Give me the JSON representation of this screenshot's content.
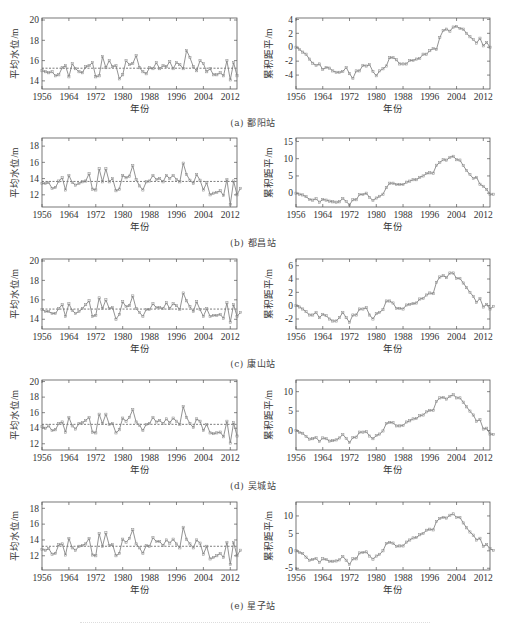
{
  "figure": {
    "footer_text": ""
  },
  "rows": [
    {
      "caption": "(a) 鄱阳站"
    },
    {
      "caption": "(b) 都昌站"
    },
    {
      "caption": "(c) 康山站"
    },
    {
      "caption": "(d) 吴城站"
    },
    {
      "caption": "(e) 星子站"
    }
  ],
  "chart_data": [
    {
      "id": "a-left",
      "station": "鄱阳站",
      "type": "line",
      "title": "",
      "xlabel": "年份",
      "ylabel": "平均水位/m",
      "xlim": [
        1956,
        2014
      ],
      "ylim": [
        13.2,
        20.2
      ],
      "xticks": [
        1956,
        1964,
        1972,
        1980,
        1988,
        1996,
        2004,
        2012
      ],
      "yticks": [
        14,
        16,
        18,
        20
      ],
      "mean_line": 15.25,
      "x_start": 1956,
      "values": [
        15.0,
        14.9,
        14.8,
        14.9,
        14.5,
        14.6,
        15.3,
        15.5,
        14.4,
        15.7,
        15.2,
        14.9,
        14.8,
        15.4,
        15.5,
        15.8,
        14.4,
        14.5,
        16.4,
        15.3,
        16.0,
        15.4,
        15.5,
        14.2,
        14.6,
        16.0,
        15.6,
        15.7,
        16.5,
        15.3,
        14.9,
        14.7,
        15.3,
        15.2,
        15.8,
        15.2,
        15.5,
        15.4,
        15.9,
        15.2,
        15.8,
        15.6,
        15.2,
        17.0,
        16.3,
        15.4,
        15.0,
        16.0,
        15.7,
        14.9,
        15.2,
        14.6,
        14.6,
        14.8,
        14.5,
        16.0,
        14.1,
        15.8,
        14.5
      ]
    },
    {
      "id": "a-right",
      "station": "鄱阳站",
      "type": "line",
      "title": "",
      "xlabel": "年份",
      "ylabel": "累积距平/m",
      "xlim": [
        1956,
        2014
      ],
      "ylim": [
        -6,
        4.2
      ],
      "xticks": [
        1956,
        1964,
        1972,
        1980,
        1988,
        1996,
        2004,
        2012
      ],
      "yticks": [
        -4,
        -2,
        0,
        2,
        4
      ],
      "x_start": 1956,
      "values": [
        0.0,
        -0.3,
        -0.7,
        -1.0,
        -1.7,
        -2.3,
        -2.6,
        -2.4,
        -3.2,
        -2.9,
        -3.0,
        -3.4,
        -3.6,
        -3.6,
        -3.5,
        -2.9,
        -3.8,
        -4.5,
        -3.4,
        -3.4,
        -2.6,
        -2.7,
        -2.5,
        -3.5,
        -4.1,
        -3.4,
        -3.1,
        -2.7,
        -1.5,
        -1.5,
        -1.8,
        -2.4,
        -2.4,
        -2.4,
        -1.9,
        -1.9,
        -1.7,
        -1.6,
        -1.0,
        -1.0,
        -0.5,
        -0.2,
        -0.3,
        1.4,
        2.4,
        2.6,
        2.3,
        2.9,
        3.0,
        2.7,
        2.6,
        2.0,
        1.5,
        1.1,
        0.6,
        1.3,
        0.2,
        0.7,
        0.0
      ]
    },
    {
      "id": "b-left",
      "station": "都昌站",
      "type": "line",
      "title": "",
      "xlabel": "年份",
      "ylabel": "平均水位/m",
      "xlim": [
        1956,
        2014
      ],
      "ylim": [
        10.5,
        19.0
      ],
      "xticks": [
        1956,
        1964,
        1972,
        1980,
        1988,
        1996,
        2004,
        2012
      ],
      "yticks": [
        12,
        14,
        16,
        18
      ],
      "mean_line": 13.65,
      "x_start": 1956,
      "values": [
        13.4,
        13.4,
        13.5,
        12.8,
        12.9,
        13.7,
        14.1,
        12.6,
        14.4,
        13.5,
        13.2,
        13.4,
        13.6,
        13.7,
        14.6,
        12.7,
        12.6,
        15.2,
        13.6,
        15.2,
        13.6,
        14.0,
        12.5,
        12.7,
        14.4,
        14.1,
        14.3,
        15.6,
        13.9,
        13.1,
        12.6,
        13.6,
        13.7,
        14.4,
        13.9,
        14.0,
        13.6,
        14.4,
        14.0,
        14.4,
        13.9,
        13.6,
        15.9,
        14.5,
        13.8,
        13.4,
        14.5,
        13.8,
        12.6,
        13.5,
        12.0,
        12.2,
        12.3,
        12.5,
        11.9,
        13.9,
        10.8,
        13.7,
        12.0,
        12.8
      ]
    },
    {
      "id": "b-right",
      "station": "都昌站",
      "type": "line",
      "title": "",
      "xlabel": "年份",
      "ylabel": "累积距平/m",
      "xlim": [
        1956,
        2014
      ],
      "ylim": [
        -4,
        16
      ],
      "xticks": [
        1956,
        1964,
        1972,
        1980,
        1988,
        1996,
        2004,
        2012
      ],
      "yticks": [
        0,
        5,
        10,
        15
      ],
      "x_start": 1956,
      "values": [
        0.0,
        -0.3,
        -0.5,
        -1.0,
        -1.8,
        -2.0,
        -1.6,
        -2.6,
        -1.8,
        -2.0,
        -2.3,
        -2.5,
        -2.6,
        -2.5,
        -1.5,
        -2.4,
        -3.4,
        -1.9,
        -1.9,
        -0.4,
        -0.4,
        0.0,
        -1.2,
        -2.1,
        -1.4,
        -0.9,
        -0.3,
        1.6,
        2.9,
        2.9,
        2.5,
        2.5,
        2.5,
        3.2,
        3.5,
        3.9,
        3.9,
        4.6,
        5.0,
        5.7,
        5.9,
        5.8,
        8.1,
        8.9,
        9.7,
        9.6,
        10.4,
        10.7,
        9.7,
        9.6,
        8.0,
        6.6,
        5.4,
        4.3,
        4.6,
        2.6,
        2.0,
        1.1,
        -0.3,
        -0.3
      ]
    },
    {
      "id": "c-left",
      "station": "康山站",
      "type": "line",
      "title": "",
      "xlabel": "年份",
      "ylabel": "平均水位/m",
      "xlim": [
        1956,
        2014
      ],
      "ylim": [
        13.0,
        20.2
      ],
      "xticks": [
        1956,
        1964,
        1972,
        1980,
        1988,
        1996,
        2004,
        2012
      ],
      "yticks": [
        14,
        16,
        18,
        20
      ],
      "mean_line": 15.05,
      "x_start": 1956,
      "values": [
        15.0,
        14.8,
        14.8,
        14.6,
        14.6,
        15.1,
        15.5,
        14.3,
        15.6,
        14.9,
        14.6,
        14.8,
        15.1,
        15.5,
        15.9,
        14.3,
        14.4,
        16.2,
        15.1,
        16.0,
        15.1,
        15.2,
        14.0,
        14.5,
        15.8,
        15.3,
        15.4,
        16.4,
        15.1,
        14.7,
        14.3,
        15.0,
        15.0,
        15.6,
        15.2,
        15.2,
        15.1,
        15.7,
        15.1,
        15.6,
        15.4,
        15.0,
        16.7,
        15.9,
        15.3,
        14.8,
        15.8,
        15.0,
        14.3,
        15.1,
        14.3,
        14.4,
        14.4,
        14.5,
        14.1,
        15.7,
        13.7,
        15.5,
        14.3,
        14.7
      ]
    },
    {
      "id": "c-right",
      "station": "康山站",
      "type": "line",
      "title": "",
      "xlabel": "年份",
      "ylabel": "累积距平/m",
      "xlim": [
        1956,
        2014
      ],
      "ylim": [
        -3.5,
        7
      ],
      "xticks": [
        1956,
        1964,
        1972,
        1980,
        1988,
        1996,
        2004,
        2012
      ],
      "yticks": [
        -2,
        0,
        2,
        4,
        6
      ],
      "x_start": 1956,
      "values": [
        0.0,
        -0.2,
        -0.5,
        -0.9,
        -1.4,
        -1.4,
        -1.0,
        -1.8,
        -1.3,
        -1.5,
        -2.0,
        -2.3,
        -2.3,
        -1.8,
        -1.0,
        -1.8,
        -2.5,
        -1.4,
        -1.4,
        -0.5,
        -0.5,
        -0.3,
        -1.4,
        -2.0,
        -1.2,
        -1.0,
        -0.6,
        0.7,
        0.7,
        0.4,
        -0.4,
        -0.4,
        -0.5,
        0.1,
        0.2,
        0.3,
        0.4,
        1.0,
        1.1,
        1.6,
        1.9,
        1.8,
        3.5,
        4.3,
        4.5,
        4.2,
        4.9,
        4.9,
        4.1,
        4.1,
        3.4,
        2.7,
        2.0,
        1.4,
        0.5,
        1.1,
        -0.2,
        0.2,
        -0.5,
        -0.1
      ]
    },
    {
      "id": "d-left",
      "station": "吴城站",
      "type": "line",
      "title": "",
      "xlabel": "年份",
      "ylabel": "平均水位/m",
      "xlim": [
        1956,
        2014
      ],
      "ylim": [
        11.2,
        20.2
      ],
      "xticks": [
        1956,
        1964,
        1972,
        1980,
        1988,
        1996,
        2004,
        2012
      ],
      "yticks": [
        12,
        14,
        16,
        18,
        20
      ],
      "mean_line": 14.5,
      "x_start": 1956,
      "values": [
        14.2,
        14.0,
        14.3,
        13.7,
        13.8,
        14.6,
        14.8,
        13.5,
        15.4,
        14.3,
        13.9,
        14.6,
        14.7,
        15.0,
        15.4,
        13.5,
        13.4,
        15.8,
        14.6,
        15.8,
        14.5,
        14.6,
        13.4,
        13.8,
        15.3,
        14.9,
        15.4,
        16.4,
        14.8,
        14.4,
        13.7,
        14.5,
        14.6,
        15.4,
        14.8,
        15.0,
        14.6,
        15.2,
        14.7,
        15.3,
        14.9,
        14.5,
        16.8,
        15.4,
        14.6,
        14.1,
        15.2,
        14.9,
        13.7,
        14.5,
        13.4,
        13.3,
        13.4,
        13.5,
        12.9,
        14.9,
        12.1,
        14.7,
        13.0
      ]
    },
    {
      "id": "d-right",
      "station": "吴城站",
      "type": "line",
      "title": "",
      "xlabel": "年份",
      "ylabel": "累积距平/m",
      "xlim": [
        1956,
        2014
      ],
      "ylim": [
        -5,
        13
      ],
      "xticks": [
        1956,
        1964,
        1972,
        1980,
        1988,
        1996,
        2004,
        2012
      ],
      "yticks": [
        0,
        5,
        10
      ],
      "x_start": 1956,
      "values": [
        0.0,
        -0.5,
        -0.7,
        -1.5,
        -2.2,
        -2.1,
        -1.8,
        -2.8,
        -1.9,
        -2.1,
        -2.7,
        -2.6,
        -2.4,
        -1.9,
        -1.0,
        -2.0,
        -3.1,
        -1.8,
        -1.7,
        -0.4,
        -0.4,
        -0.3,
        -1.4,
        -2.1,
        -1.3,
        -0.9,
        -0.1,
        1.8,
        2.1,
        2.0,
        1.2,
        1.2,
        1.3,
        2.2,
        2.5,
        3.0,
        3.1,
        3.8,
        4.0,
        4.8,
        5.2,
        5.2,
        7.5,
        8.4,
        8.5,
        8.1,
        8.8,
        9.2,
        8.4,
        8.4,
        7.3,
        6.1,
        5.0,
        4.0,
        2.4,
        2.8,
        0.4,
        0.6,
        -0.9,
        -1.0
      ]
    },
    {
      "id": "e-left",
      "station": "星子站",
      "type": "line",
      "title": "",
      "xlabel": "年份",
      "ylabel": "平均水位/m",
      "xlim": [
        1956,
        2014
      ],
      "ylim": [
        10.2,
        18.8
      ],
      "xticks": [
        1956,
        1964,
        1972,
        1980,
        1988,
        1996,
        2004,
        2012
      ],
      "yticks": [
        12,
        14,
        16,
        18
      ],
      "mean_line": 13.2,
      "x_start": 1956,
      "values": [
        12.8,
        12.7,
        12.9,
        12.2,
        12.3,
        13.4,
        13.5,
        12.1,
        14.2,
        13.0,
        12.7,
        13.2,
        13.3,
        13.5,
        14.2,
        12.1,
        12.0,
        14.8,
        13.2,
        14.9,
        13.3,
        13.4,
        12.0,
        12.3,
        14.1,
        13.7,
        14.2,
        15.3,
        13.5,
        13.0,
        12.3,
        13.3,
        13.2,
        14.3,
        13.8,
        13.8,
        13.3,
        14.0,
        13.6,
        14.1,
        13.5,
        13.0,
        15.6,
        14.1,
        13.5,
        13.0,
        14.0,
        13.6,
        12.2,
        13.2,
        11.6,
        11.8,
        12.0,
        12.3,
        11.8,
        13.7,
        10.9,
        13.7,
        12.0,
        12.7
      ]
    },
    {
      "id": "e-right",
      "station": "星子站",
      "type": "line",
      "title": "",
      "xlabel": "年份",
      "ylabel": "累积距平/m",
      "xlim": [
        1956,
        2014
      ],
      "ylim": [
        -5.5,
        14
      ],
      "xticks": [
        1956,
        1964,
        1972,
        1980,
        1988,
        1996,
        2004,
        2012
      ],
      "yticks": [
        -5,
        0,
        5,
        10
      ],
      "x_start": 1956,
      "values": [
        0.0,
        -0.5,
        -0.8,
        -1.8,
        -2.7,
        -2.5,
        -2.2,
        -3.3,
        -2.3,
        -2.5,
        -3.0,
        -3.0,
        -2.9,
        -2.6,
        -1.6,
        -2.7,
        -3.9,
        -2.3,
        -2.3,
        -0.6,
        -0.5,
        -0.3,
        -1.5,
        -2.4,
        -1.5,
        -1.0,
        0.0,
        2.1,
        2.4,
        2.2,
        1.3,
        1.4,
        1.4,
        2.5,
        3.1,
        3.7,
        3.8,
        4.6,
        5.0,
        5.9,
        6.2,
        6.0,
        8.4,
        9.3,
        9.6,
        9.4,
        10.2,
        10.6,
        9.6,
        9.6,
        8.0,
        6.6,
        5.4,
        4.5,
        3.1,
        3.6,
        1.3,
        1.8,
        0.6,
        0.1
      ]
    }
  ]
}
